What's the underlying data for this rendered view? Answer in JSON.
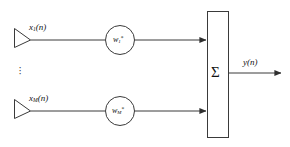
{
  "diagram": {
    "type": "block-diagram",
    "background_color": "#ffffff",
    "line_color": "#3a3a3a",
    "text_color": "#111111",
    "inputs": [
      {
        "id": "input-1",
        "base": "x",
        "subscript": "1",
        "argument": "(n)",
        "text": "x₁(n)"
      },
      {
        "id": "input-M",
        "base": "x",
        "subscript": "M",
        "argument": "(n)",
        "text": "xₘ(n)"
      }
    ],
    "weights": [
      {
        "id": "weight-1",
        "base": "w",
        "subscript": "1",
        "superscript": "*",
        "text": "w₁*"
      },
      {
        "id": "weight-M",
        "base": "w",
        "subscript": "M",
        "superscript": "*",
        "text": "wₘ*"
      }
    ],
    "summation": {
      "symbol": "Σ",
      "name": "summation-block"
    },
    "output": {
      "base": "y",
      "argument": "(n)",
      "text": "y(n)"
    },
    "ellipsis": {
      "symbol": "·",
      "count": 3,
      "meaning": "additional channels omitted"
    }
  }
}
